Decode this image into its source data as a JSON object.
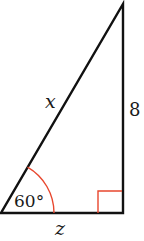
{
  "diagram": {
    "type": "right-triangle",
    "labels": {
      "hypotenuse": "x",
      "vertical_side": "8",
      "base": "z",
      "angle": "60°"
    },
    "colors": {
      "stroke": "#111111",
      "angle_marker": "#e8472e",
      "background": "#ffffff"
    }
  }
}
